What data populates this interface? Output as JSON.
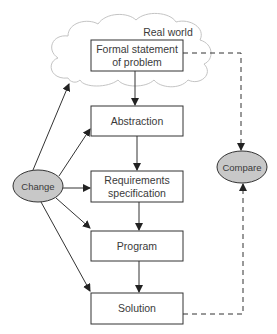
{
  "diagram": {
    "region_label": "Real world",
    "boxes": [
      {
        "id": "formal",
        "line1": "Formal statement",
        "line2": "of problem"
      },
      {
        "id": "abstraction",
        "line1": "Abstraction"
      },
      {
        "id": "requirements",
        "line1": "Requirements",
        "line2": "specification"
      },
      {
        "id": "program",
        "line1": "Program"
      },
      {
        "id": "solution",
        "line1": "Solution"
      }
    ],
    "nodes": [
      {
        "id": "change",
        "label": "Change"
      },
      {
        "id": "compare",
        "label": "Compare"
      }
    ],
    "edges": [
      {
        "from": "formal",
        "to": "abstraction",
        "style": "solid"
      },
      {
        "from": "abstraction",
        "to": "requirements",
        "style": "solid"
      },
      {
        "from": "requirements",
        "to": "program",
        "style": "solid"
      },
      {
        "from": "program",
        "to": "solution",
        "style": "solid"
      },
      {
        "from": "change",
        "to": "real-world",
        "style": "solid"
      },
      {
        "from": "change",
        "to": "abstraction",
        "style": "solid"
      },
      {
        "from": "change",
        "to": "requirements",
        "style": "solid"
      },
      {
        "from": "change",
        "to": "program",
        "style": "solid"
      },
      {
        "from": "change",
        "to": "solution",
        "style": "solid"
      },
      {
        "from": "formal",
        "to": "compare",
        "style": "dashed"
      },
      {
        "from": "solution",
        "to": "compare",
        "style": "dashed"
      }
    ],
    "colors": {
      "stroke": "#333333",
      "node_fill": "#c8c8c8",
      "cloud_stroke": "#c4c4c4"
    }
  }
}
